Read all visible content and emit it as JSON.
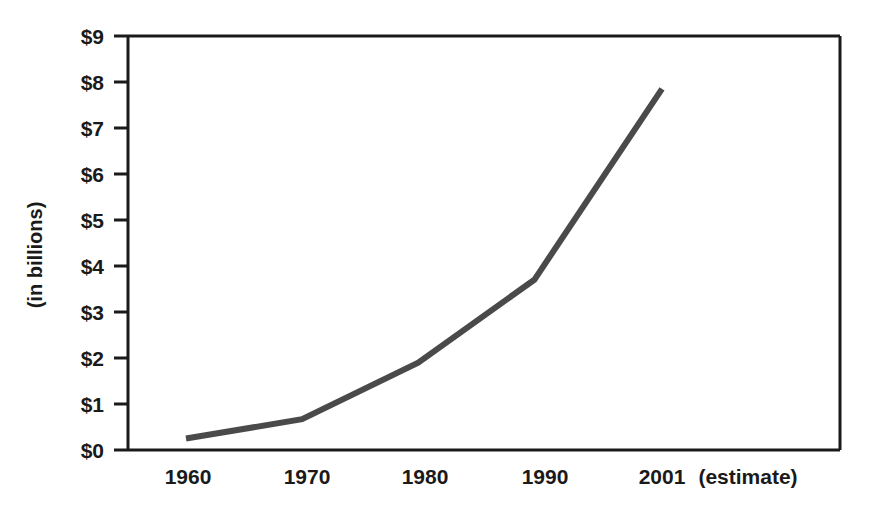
{
  "chart_data": {
    "type": "line",
    "title": "",
    "subtitle": "",
    "xlabel": "",
    "ylabel": "(in billions)",
    "x_note": "(estimate)",
    "categories": [
      "1960",
      "1970",
      "1980",
      "1990",
      "2001"
    ],
    "x": [
      1960,
      1970,
      1980,
      1990,
      2001
    ],
    "values": [
      0.25,
      0.67,
      1.9,
      3.7,
      7.85
    ],
    "series": [
      {
        "name": "",
        "values": [
          0.25,
          0.67,
          1.9,
          3.7,
          7.85
        ]
      }
    ],
    "ylim": [
      0,
      9
    ],
    "ytick_labels": [
      "$0",
      "$1",
      "$2",
      "$3",
      "$4",
      "$5",
      "$6",
      "$7",
      "$8",
      "$9"
    ],
    "ytick_values": [
      0,
      1,
      2,
      3,
      4,
      5,
      6,
      7,
      8,
      9
    ],
    "xtick_labels": [
      "1960",
      "1970",
      "1980",
      "1990",
      "2001"
    ],
    "grid": false,
    "legend": false,
    "legend_position": "none",
    "line_color": "#4a4a4a",
    "axis_color": "#1a1a1a",
    "background_color": "#ffffff"
  },
  "axis": {
    "y_title": "(in billions)",
    "x_estimate_note": "(estimate)"
  },
  "ticks": {
    "y": [
      {
        "label": "$9",
        "value": 9
      },
      {
        "label": "$8",
        "value": 8
      },
      {
        "label": "$7",
        "value": 7
      },
      {
        "label": "$6",
        "value": 6
      },
      {
        "label": "$5",
        "value": 5
      },
      {
        "label": "$4",
        "value": 4
      },
      {
        "label": "$3",
        "value": 3
      },
      {
        "label": "$2",
        "value": 2
      },
      {
        "label": "$1",
        "value": 1
      },
      {
        "label": "$0",
        "value": 0
      }
    ],
    "x": [
      {
        "label": "1960",
        "value": 1960
      },
      {
        "label": "1970",
        "value": 1970
      },
      {
        "label": "1980",
        "value": 1980
      },
      {
        "label": "1990",
        "value": 1990
      },
      {
        "label": "2001",
        "value": 2001
      }
    ]
  }
}
